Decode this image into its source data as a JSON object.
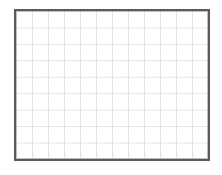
{
  "grid": {
    "columns": 12,
    "rows": 9,
    "line_color": "#e2e2e2",
    "border_color": "#5a5a5a",
    "background_color": "#ffffff"
  }
}
